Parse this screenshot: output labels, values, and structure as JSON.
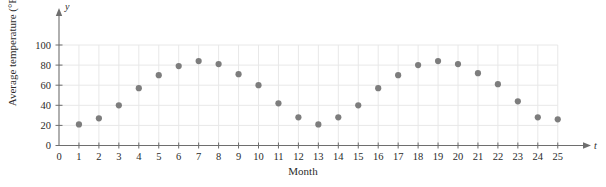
{
  "chart_data": {
    "type": "scatter",
    "title": "",
    "xlabel": "Month",
    "ylabel": "Average temperature (°F)",
    "x_axis_variable": "t",
    "y_axis_variable": "y",
    "xlim": [
      0,
      25
    ],
    "ylim": [
      0,
      100
    ],
    "xticks": [
      0,
      1,
      2,
      3,
      4,
      5,
      6,
      7,
      8,
      9,
      10,
      11,
      12,
      13,
      14,
      15,
      16,
      17,
      18,
      19,
      20,
      21,
      22,
      23,
      24,
      25
    ],
    "yticks": [
      0,
      20,
      40,
      60,
      80,
      100
    ],
    "xtick_labels": [
      "0",
      "1",
      "2",
      "3",
      "4",
      "5",
      "6",
      "7",
      "8",
      "9",
      "10",
      "11",
      "12",
      "13",
      "14",
      "15",
      "16",
      "17",
      "18",
      "19",
      "20",
      "21",
      "22",
      "23",
      "24",
      "25"
    ],
    "ytick_labels": [
      "0",
      "20",
      "40",
      "60",
      "80",
      "100"
    ],
    "grid": true,
    "legend": null,
    "marker_color": "#7d7d7d",
    "grid_color": "#e8e8e8",
    "axis_color": "#6e6e6e",
    "x": [
      1,
      2,
      3,
      4,
      5,
      6,
      7,
      8,
      9,
      10,
      11,
      12,
      13,
      14,
      15,
      16,
      17,
      18,
      19,
      20,
      21,
      22,
      23,
      24,
      25
    ],
    "values": [
      21,
      27,
      40,
      57,
      70,
      79,
      84,
      81,
      71,
      60,
      42,
      28,
      21,
      28,
      40,
      57,
      70,
      80,
      84,
      81,
      72,
      61,
      44,
      28,
      26
    ],
    "points": [
      {
        "t": 1,
        "y": 21
      },
      {
        "t": 2,
        "y": 27
      },
      {
        "t": 3,
        "y": 40
      },
      {
        "t": 4,
        "y": 57
      },
      {
        "t": 5,
        "y": 70
      },
      {
        "t": 6,
        "y": 79
      },
      {
        "t": 7,
        "y": 84
      },
      {
        "t": 8,
        "y": 81
      },
      {
        "t": 9,
        "y": 71
      },
      {
        "t": 10,
        "y": 60
      },
      {
        "t": 11,
        "y": 42
      },
      {
        "t": 12,
        "y": 28
      },
      {
        "t": 13,
        "y": 21
      },
      {
        "t": 14,
        "y": 28
      },
      {
        "t": 15,
        "y": 40
      },
      {
        "t": 16,
        "y": 57
      },
      {
        "t": 17,
        "y": 70
      },
      {
        "t": 18,
        "y": 80
      },
      {
        "t": 19,
        "y": 84
      },
      {
        "t": 20,
        "y": 81
      },
      {
        "t": 21,
        "y": 72
      },
      {
        "t": 22,
        "y": 61
      },
      {
        "t": 23,
        "y": 44
      },
      {
        "t": 24,
        "y": 28
      },
      {
        "t": 25,
        "y": 26
      }
    ]
  },
  "labels": {
    "y_axis_title": "Average temperature (°F)",
    "x_axis_title": "Month",
    "y_variable": "y",
    "x_variable": "t"
  }
}
